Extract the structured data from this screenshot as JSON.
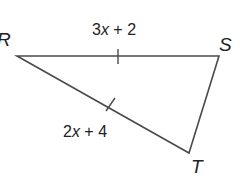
{
  "diagram": {
    "type": "triangle",
    "stroke_color": "#4a4a4a",
    "text_color": "#222222",
    "vertices": [
      {
        "name": "R",
        "x": 17,
        "y": 56
      },
      {
        "name": "S",
        "x": 219,
        "y": 56
      },
      {
        "name": "T",
        "x": 189,
        "y": 153
      }
    ],
    "labels": {
      "R": "R",
      "S": "S",
      "T": "T"
    },
    "sides": [
      {
        "segment": "RS",
        "expression": "3x + 2",
        "coef": "3",
        "var": "x",
        "rest": " + 2",
        "tick_marks": 1
      },
      {
        "segment": "RT",
        "expression": "2x + 4",
        "coef": "2",
        "var": "x",
        "rest": " + 4",
        "tick_marks": 1
      },
      {
        "segment": "ST",
        "expression": "",
        "tick_marks": 0
      }
    ]
  }
}
